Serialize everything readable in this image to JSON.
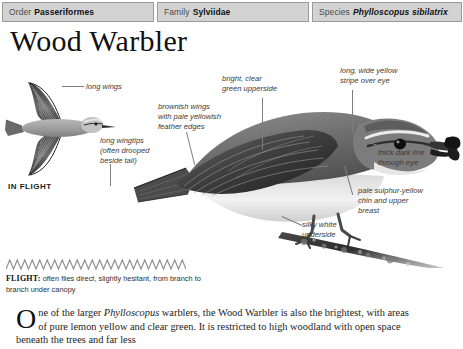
{
  "taxonomy": {
    "order": {
      "label": "Order",
      "value": "Passeriformes"
    },
    "family": {
      "label": "Family",
      "value": "Sylviidae"
    },
    "species": {
      "label": "Species",
      "value": "Phylloscopus sibilatrix"
    }
  },
  "title": "Wood Warbler",
  "illustration": {
    "in_flight_label": "IN FLIGHT",
    "annotations": {
      "long_wings": "long wings",
      "long_wingtips": "long wingtips\n(often drooped\nbeside tail)",
      "brownish_wings": "brownish wings\nwith pale yellowish\nfeather edges",
      "green_upperside": "bright, clear\ngreen upperside",
      "yellow_stripe": "long, wide yellow\nstripe over eye",
      "dark_line": "thick dark line\nthrough eye",
      "sulphur_chin": "pale sulphur-yellow\nchin and upper\nbreast",
      "silky_underside": "silky white\nunderside"
    }
  },
  "flight": {
    "key": "FLIGHT:",
    "description": " often flies direct, slightly hesitant, from branch to branch under canopy",
    "zigzag_peaks": 24
  },
  "body": {
    "dropcap": "O",
    "text_before_sci": "ne of the larger ",
    "sci_name": "Phylloscopus",
    "text_after_sci": " warblers, the Wood Warbler is also the brightest, with areas of pure lemon yellow and clear green. It is restricted to high woodland with open space beneath the trees and far less"
  },
  "colors": {
    "header_bg": "#d3d3d3",
    "header_border": "#9a9a9a",
    "leader_line": "#7d7d7d",
    "note_text": "#3a3a3a",
    "zigzag": "#8c8c8c"
  }
}
